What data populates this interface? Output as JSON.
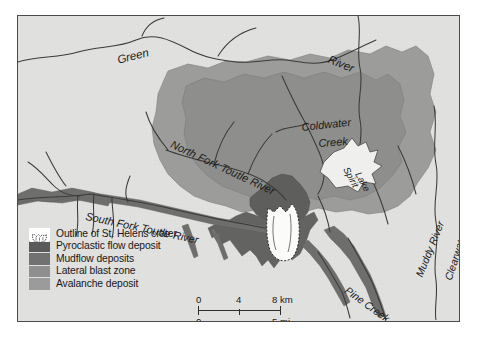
{
  "map": {
    "title": "Mount St. Helens eruption deposits map",
    "background_color": "#e0e0de",
    "border_color": "#4b4b4b",
    "labels": [
      {
        "name": "green-river-left",
        "text": "Green",
        "x": 98,
        "y": 38,
        "rotate": -14,
        "size": 11.5
      },
      {
        "name": "green-river-right",
        "text": "River",
        "x": 313,
        "y": 37,
        "rotate": 22,
        "size": 11.5
      },
      {
        "name": "coldwater-creek-line1",
        "text": "Coldwater",
        "x": 283,
        "y": 105,
        "rotate": -6,
        "size": 11.0
      },
      {
        "name": "coldwater-creek-line2",
        "text": "Creek",
        "x": 300,
        "y": 121,
        "rotate": -4,
        "size": 11.0
      },
      {
        "name": "north-fork-toutle",
        "text": "North Fork Toutle River",
        "x": 156,
        "y": 122,
        "rotate": 25,
        "size": 11.0
      },
      {
        "name": "spirit-lake-line1",
        "text": "Spirit",
        "x": 333,
        "y": 149,
        "rotate": 62,
        "size": 9.5
      },
      {
        "name": "spirit-lake-line2",
        "text": "Lake",
        "x": 345,
        "y": 154,
        "rotate": 62,
        "size": 9.5
      },
      {
        "name": "south-fork-toutle",
        "text": "South Fork Toutle River",
        "x": 69,
        "y": 194,
        "rotate": 12,
        "size": 11.0
      },
      {
        "name": "clearwater-creek",
        "text": "Clearwater Creek",
        "x": 424,
        "y": 262,
        "rotate": -72,
        "size": 10.5
      },
      {
        "name": "muddy-river",
        "text": "Muddy River",
        "x": 395,
        "y": 258,
        "rotate": -68,
        "size": 10.5
      },
      {
        "name": "pine-creek",
        "text": "Pine Creek",
        "x": 332,
        "y": 268,
        "rotate": 36,
        "size": 10.5
      }
    ]
  },
  "legend": {
    "items": [
      {
        "label": "Outline of St. Helens crater",
        "color": "#ffffff",
        "swatch_type": "crater-outline"
      },
      {
        "label": "Pyroclastic flow deposit",
        "color": "#5a5a5a",
        "swatch_type": "solid"
      },
      {
        "label": "Mudflow deposits",
        "color": "#717171",
        "swatch_type": "solid"
      },
      {
        "label": "Lateral blast zone",
        "color": "#8f8f8f",
        "swatch_type": "solid"
      },
      {
        "label": "Avalanche deposit",
        "color": "#9b9b9b",
        "swatch_type": "solid"
      }
    ]
  },
  "scalebar": {
    "km_ticks": [
      "0",
      "4",
      "8 km"
    ],
    "mi_ticks": [
      "0",
      "5 mi"
    ],
    "km_max": 8,
    "mi_max": 5
  }
}
